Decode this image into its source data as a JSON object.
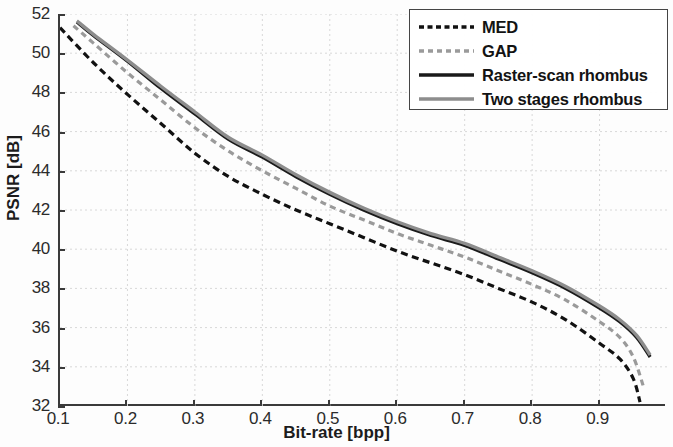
{
  "chart_data": {
    "type": "line",
    "title": "",
    "xlabel": "Bit-rate [bpp]",
    "ylabel": "PSNR [dB]",
    "xlim": [
      0.1,
      1.0
    ],
    "ylim": [
      32,
      52
    ],
    "xticks": [
      "0.1",
      "0.2",
      "0.3",
      "0.4",
      "0.5",
      "0.6",
      "0.7",
      "0.8",
      "0.9"
    ],
    "yticks": [
      "32",
      "34",
      "36",
      "38",
      "40",
      "42",
      "44",
      "46",
      "48",
      "50",
      "52"
    ],
    "grid": true,
    "legend_position": "upper-right",
    "series": [
      {
        "name": "MED",
        "style": "dash-dot",
        "color": "#111111",
        "x": [
          0.1,
          0.15,
          0.2,
          0.25,
          0.3,
          0.35,
          0.4,
          0.45,
          0.5,
          0.55,
          0.6,
          0.65,
          0.7,
          0.75,
          0.8,
          0.85,
          0.9,
          0.93,
          0.95,
          0.96
        ],
        "y": [
          51.3,
          49.5,
          47.9,
          46.4,
          44.9,
          43.7,
          42.8,
          42.0,
          41.3,
          40.6,
          39.9,
          39.3,
          38.7,
          38.0,
          37.3,
          36.4,
          35.2,
          34.4,
          33.4,
          32.2
        ]
      },
      {
        "name": "GAP",
        "style": "dash-dot",
        "color": "#9a9a9a",
        "x": [
          0.12,
          0.15,
          0.2,
          0.25,
          0.3,
          0.35,
          0.4,
          0.45,
          0.5,
          0.55,
          0.6,
          0.65,
          0.7,
          0.75,
          0.8,
          0.85,
          0.9,
          0.93,
          0.95,
          0.965
        ],
        "y": [
          51.4,
          50.5,
          49.0,
          47.6,
          46.2,
          45.0,
          44.0,
          43.1,
          42.2,
          41.5,
          40.8,
          40.2,
          39.6,
          38.9,
          38.2,
          37.4,
          36.3,
          35.5,
          34.5,
          33.0
        ]
      },
      {
        "name": "Raster-scan rhombus",
        "style": "solid",
        "color": "#1a1a1a",
        "x": [
          0.125,
          0.15,
          0.2,
          0.25,
          0.3,
          0.35,
          0.4,
          0.45,
          0.5,
          0.55,
          0.6,
          0.65,
          0.7,
          0.75,
          0.8,
          0.85,
          0.9,
          0.93,
          0.955,
          0.975
        ],
        "y": [
          51.6,
          50.9,
          49.6,
          48.2,
          46.9,
          45.6,
          44.7,
          43.7,
          42.8,
          42.0,
          41.3,
          40.7,
          40.2,
          39.5,
          38.8,
          38.0,
          37.0,
          36.3,
          35.5,
          34.5
        ]
      },
      {
        "name": "Two stages rhombus",
        "style": "solid",
        "color": "#8d8d8d",
        "x": [
          0.125,
          0.15,
          0.2,
          0.25,
          0.3,
          0.35,
          0.4,
          0.45,
          0.5,
          0.55,
          0.6,
          0.65,
          0.7,
          0.75,
          0.8,
          0.85,
          0.9,
          0.93,
          0.955,
          0.975
        ],
        "y": [
          51.65,
          50.95,
          49.65,
          48.3,
          47.0,
          45.7,
          44.8,
          43.8,
          42.9,
          42.1,
          41.4,
          40.8,
          40.3,
          39.6,
          38.9,
          38.1,
          37.1,
          36.4,
          35.6,
          34.6
        ]
      }
    ]
  },
  "legend": {
    "items": [
      {
        "label": "MED"
      },
      {
        "label": "GAP"
      },
      {
        "label": "Raster-scan rhombus"
      },
      {
        "label": "Two stages rhombus"
      }
    ]
  },
  "colors": {
    "axis": "#3a3a3a",
    "grid": "#d8d8d8",
    "black_series": "#111111",
    "gray_series": "#9a9a9a",
    "background": "#fdfdfd"
  }
}
